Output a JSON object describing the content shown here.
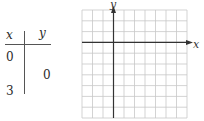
{
  "table": {
    "headers": [
      "x",
      "y"
    ],
    "rows": [
      {
        "x": "0",
        "y": ""
      },
      {
        "x": "",
        "y": "0"
      },
      {
        "x": "3",
        "y": ""
      }
    ]
  },
  "graph": {
    "x_label": "x",
    "y_label": "y",
    "grid": {
      "columns": 10,
      "rows": 10,
      "origin_column": 3,
      "origin_row": 3
    },
    "colors": {
      "grid": "#c8c8c8",
      "axis": "#333333"
    }
  }
}
